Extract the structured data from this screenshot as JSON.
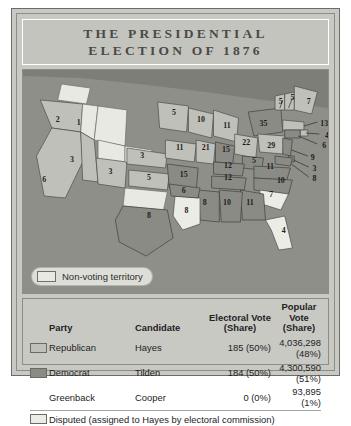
{
  "title": {
    "line1": "THE PRESIDENTIAL",
    "line2": "ELECTION OF 1876"
  },
  "colors": {
    "republican": "#c0c0bb",
    "democrat": "#8b8b86",
    "disputed": "#ececE7",
    "non_voting": "#e9e9e4",
    "ocean": "#8f8f8a",
    "paper": "#c9c9c4"
  },
  "map": {
    "legend": {
      "swatch_label": "Non-voting territory"
    },
    "states": [
      {
        "name": "Washington Territory",
        "votes": "",
        "party": "nonvoting",
        "x": 47,
        "y": 26
      },
      {
        "name": "Oregon",
        "votes": "2",
        "party": "republican",
        "x": 36,
        "y": 52
      },
      {
        "name": "Idaho Territory",
        "votes": "1",
        "party": "nonvoting",
        "x": 58,
        "y": 55
      },
      {
        "name": "California",
        "votes": "6",
        "party": "republican",
        "x": 22,
        "y": 112
      },
      {
        "name": "Nevada",
        "votes": "3",
        "party": "republican",
        "x": 51,
        "y": 92
      },
      {
        "name": "Colorado",
        "votes": "3",
        "party": "republican",
        "x": 91,
        "y": 104
      },
      {
        "name": "Nebraska",
        "votes": "3",
        "party": "republican",
        "x": 124,
        "y": 88
      },
      {
        "name": "Kansas",
        "votes": "5",
        "party": "republican",
        "x": 131,
        "y": 110
      },
      {
        "name": "Minnesota",
        "votes": "5",
        "party": "republican",
        "x": 157,
        "y": 45
      },
      {
        "name": "Wisconsin",
        "votes": "10",
        "party": "republican",
        "x": 185,
        "y": 52
      },
      {
        "name": "Michigan",
        "votes": "11",
        "party": "republican",
        "x": 212,
        "y": 58
      },
      {
        "name": "Iowa",
        "votes": "11",
        "party": "republican",
        "x": 163,
        "y": 80
      },
      {
        "name": "Missouri",
        "votes": "15",
        "party": "democrat",
        "x": 167,
        "y": 107
      },
      {
        "name": "Illinois",
        "votes": "21",
        "party": "republican",
        "x": 190,
        "y": 80
      },
      {
        "name": "Indiana",
        "votes": "15",
        "party": "democrat",
        "x": 211,
        "y": 82
      },
      {
        "name": "Ohio",
        "votes": "22",
        "party": "republican",
        "x": 232,
        "y": 75
      },
      {
        "name": "Pennsylvania",
        "votes": "29",
        "party": "republican",
        "x": 258,
        "y": 78
      },
      {
        "name": "New York",
        "votes": "35",
        "party": "democrat",
        "x": 250,
        "y": 56
      },
      {
        "name": "Vermont",
        "votes": "5",
        "party": "republican",
        "x": 268,
        "y": 34
      },
      {
        "name": "New Hampshire",
        "votes": "5",
        "party": "republican",
        "x": 280,
        "y": 30
      },
      {
        "name": "Maine",
        "votes": "7",
        "party": "republican",
        "x": 297,
        "y": 34
      },
      {
        "name": "Massachusetts",
        "votes": "13",
        "party": "republican",
        "x": 313,
        "y": 56
      },
      {
        "name": "Rhode Island",
        "votes": "4",
        "party": "republican",
        "x": 316,
        "y": 68
      },
      {
        "name": "Connecticut",
        "votes": "6",
        "party": "democrat",
        "x": 313,
        "y": 78
      },
      {
        "name": "New Jersey",
        "votes": "9",
        "party": "democrat",
        "x": 301,
        "y": 90
      },
      {
        "name": "Delaware",
        "votes": "3",
        "party": "democrat",
        "x": 303,
        "y": 101
      },
      {
        "name": "Maryland",
        "votes": "8",
        "party": "democrat",
        "x": 303,
        "y": 111
      },
      {
        "name": "West Virginia",
        "votes": "5",
        "party": "democrat",
        "x": 240,
        "y": 93
      },
      {
        "name": "Virginia",
        "votes": "11",
        "party": "democrat",
        "x": 257,
        "y": 99
      },
      {
        "name": "Kentucky",
        "votes": "12",
        "party": "democrat",
        "x": 213,
        "y": 98
      },
      {
        "name": "Tennessee",
        "votes": "12",
        "party": "democrat",
        "x": 213,
        "y": 110
      },
      {
        "name": "North Carolina",
        "votes": "10",
        "party": "democrat",
        "x": 268,
        "y": 113
      },
      {
        "name": "South Carolina",
        "votes": "7",
        "party": "disputed",
        "x": 258,
        "y": 127
      },
      {
        "name": "Georgia",
        "votes": "11",
        "party": "democrat",
        "x": 236,
        "y": 135
      },
      {
        "name": "Florida",
        "votes": "4",
        "party": "disputed",
        "x": 271,
        "y": 163
      },
      {
        "name": "Alabama",
        "votes": "10",
        "party": "democrat",
        "x": 212,
        "y": 135
      },
      {
        "name": "Mississippi",
        "votes": "8",
        "party": "democrat",
        "x": 189,
        "y": 135
      },
      {
        "name": "Louisiana",
        "votes": "8",
        "party": "disputed",
        "x": 170,
        "y": 143
      },
      {
        "name": "Arkansas",
        "votes": "6",
        "party": "democrat",
        "x": 167,
        "y": 123
      },
      {
        "name": "Texas",
        "votes": "8",
        "party": "democrat",
        "x": 131,
        "y": 148
      }
    ]
  },
  "table": {
    "headers": {
      "party": "Party",
      "candidate": "Candidate",
      "electoral": "Electoral Vote\n(Share)",
      "electoral_l1": "Electoral Vote",
      "electoral_l2": "(Share)",
      "popular_l1": "Popular Vote",
      "popular_l2": "(Share)"
    },
    "rows": [
      {
        "swatch": "republican",
        "party": "Republican",
        "candidate": "Hayes",
        "electoral": "185 (50%)",
        "popular": "4,036,298 (48%)"
      },
      {
        "swatch": "democrat",
        "party": "Democrat",
        "candidate": "Tilden",
        "electoral": "184 (50%)",
        "popular": "4,300,590 (51%)"
      },
      {
        "swatch": "none",
        "party": "Greenback",
        "candidate": "Cooper",
        "electoral": "0 (0%)",
        "popular": "93,895 (1%)"
      }
    ],
    "footnote": "Disputed (assigned to Hayes by electoral commission)"
  }
}
